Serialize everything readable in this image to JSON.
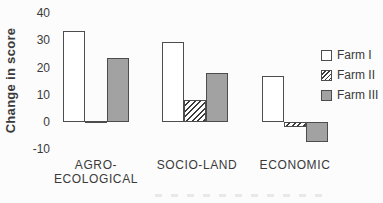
{
  "chart_data": {
    "type": "bar",
    "title": "",
    "ylabel": "Change in score",
    "xlabel": "",
    "categories": [
      "AGRO-\nECOLOGICAL",
      "SOCIO-LAND",
      "ECONOMIC"
    ],
    "yticks": [
      40,
      30,
      20,
      10,
      0,
      -10
    ],
    "ylim": [
      -10,
      40
    ],
    "grid": false,
    "legend_position": "right",
    "series": [
      {
        "name": "Farm I",
        "pattern": "white",
        "values": [
          33.5,
          29.5,
          17
        ]
      },
      {
        "name": "Farm II",
        "pattern": "hatched-diagonal",
        "values": [
          0.5,
          8,
          -2
        ]
      },
      {
        "name": "Farm III",
        "pattern": "gray",
        "values": [
          23.5,
          18,
          -7.5
        ]
      }
    ],
    "colors": {
      "bar_outline": "#4d4d4d",
      "farm1_fill": "#ffffff",
      "farm3_fill": "#a2a2a2",
      "text": "#3a3a3a",
      "background": "#fcfcfc"
    }
  }
}
